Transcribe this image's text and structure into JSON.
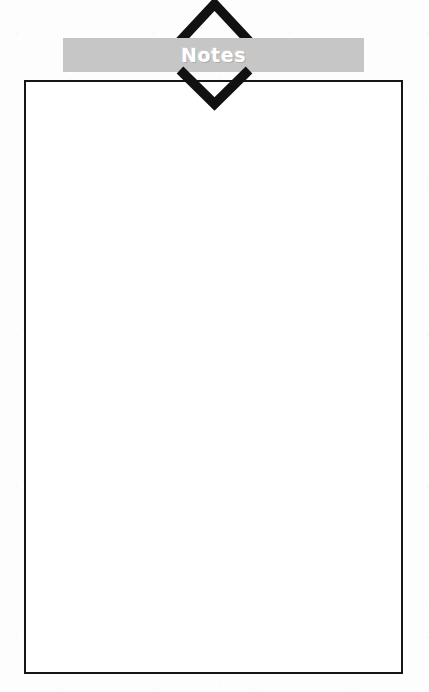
{
  "page": {
    "background_color": "#fdfdfd",
    "width": 429,
    "height": 692
  },
  "header": {
    "banner": {
      "title": "Notes",
      "background_color": "#c6c6c6",
      "text_color": "#ffffff"
    },
    "chevron_up": {
      "icon": "chevron-up-icon",
      "color": "#111111"
    },
    "chevron_down": {
      "icon": "chevron-down-icon",
      "color": "#111111"
    }
  },
  "notes_box": {
    "border_color": "#161616",
    "fill_color": "#ffffff",
    "content": "",
    "placeholder": ""
  }
}
